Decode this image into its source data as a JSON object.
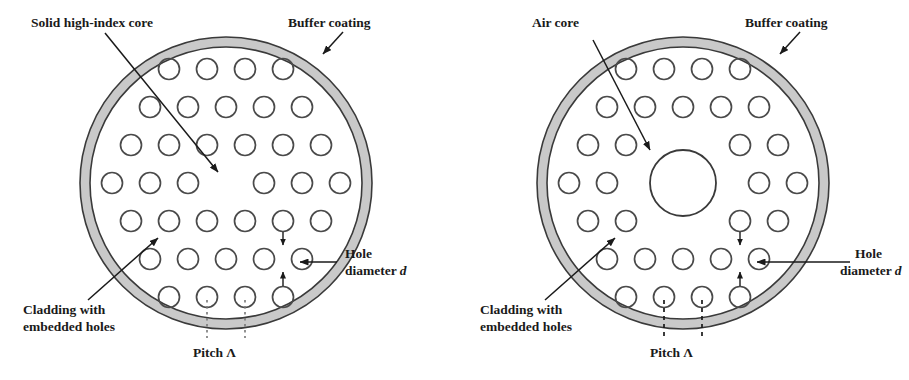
{
  "figure": {
    "title_present": false,
    "background_color": "#ffffff",
    "stroke_color": "#3a3a3a",
    "buffer_fill_color": "#c9c9c9",
    "text_color": "#1a1a1a",
    "panels": [
      {
        "id": "index-guiding-pcf",
        "name": "solid-core-photonic-crystal-fiber",
        "center": {
          "x": 226,
          "y": 183
        },
        "outer_radius": 146,
        "inner_radius": 136,
        "core_type": "solid",
        "hole_radius": 10.5,
        "pitch": 38,
        "lattice_rows": [
          4,
          5,
          6,
          7,
          6,
          5,
          4
        ],
        "missing_center_holes": 1,
        "labels": {
          "core": "Solid high-index core",
          "buffer": "Buffer coating",
          "cladding_line1": "Cladding with",
          "cladding_line2": "embedded holes",
          "pitch": "Pitch Λ",
          "hole_line1": "Hole",
          "hole_line2_prefix": "diameter ",
          "hole_line2_symbol": "d"
        }
      },
      {
        "id": "air-guiding-pcf",
        "name": "hollow-core-photonic-crystal-fiber",
        "center": {
          "x": 683,
          "y": 183
        },
        "outer_radius": 146,
        "inner_radius": 136,
        "core_type": "air",
        "air_core_radius": 33,
        "hole_radius": 10.5,
        "pitch": 38,
        "lattice_rows": [
          4,
          5,
          6,
          7,
          6,
          5,
          4
        ],
        "missing_center_holes": 7,
        "labels": {
          "core": "Air core",
          "buffer": "Buffer coating",
          "cladding_line1": "Cladding with",
          "cladding_line2": "embedded holes",
          "pitch": "Pitch Λ",
          "hole_line1": "Hole",
          "hole_line2_prefix": "diameter ",
          "hole_line2_symbol": "d"
        }
      }
    ]
  },
  "left_panel_text": {
    "core_label": "Solid high-index core",
    "buffer_label": "Buffer coating",
    "cladding_label_1": "Cladding with",
    "cladding_label_2": "embedded holes",
    "pitch_label": "Pitch Λ",
    "hole_label_1": "Hole",
    "hole_label_2a": "diameter ",
    "hole_label_2b": "d"
  },
  "right_panel_text": {
    "core_label": "Air core",
    "buffer_label": "Buffer coating",
    "cladding_label_1": "Cladding with",
    "cladding_label_2": "embedded holes",
    "pitch_label": "Pitch Λ",
    "hole_label_1": "Hole",
    "hole_label_2a": "diameter ",
    "hole_label_2b": "d"
  }
}
